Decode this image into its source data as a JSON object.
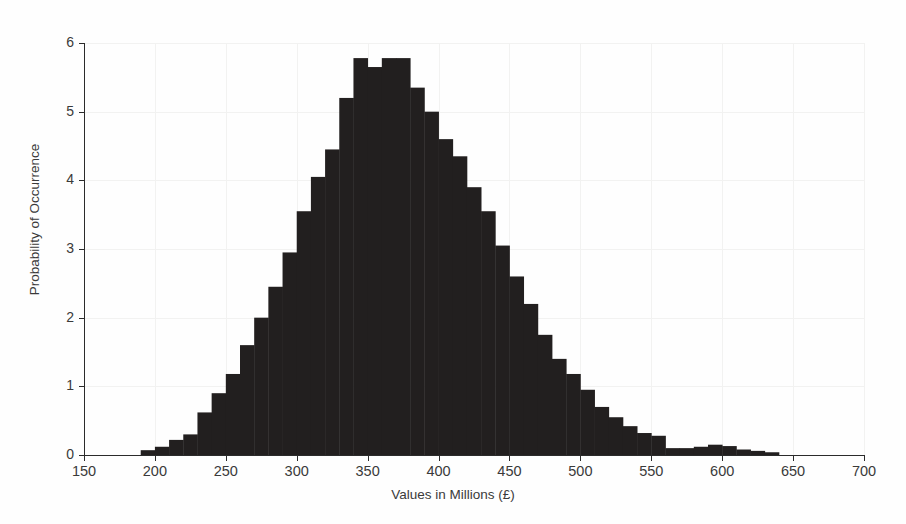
{
  "chart_data": {
    "type": "bar",
    "title": "",
    "subtitle": "",
    "xlabel": "Values in Millions (£)",
    "ylabel": "Probability of Occurrence",
    "xlim": [
      150,
      700
    ],
    "ylim": [
      0,
      6
    ],
    "xticks": [
      150,
      200,
      250,
      300,
      350,
      400,
      450,
      500,
      550,
      600,
      650,
      700
    ],
    "yticks": [
      0,
      1,
      2,
      3,
      4,
      5,
      6
    ],
    "xtick_labels": [
      "150",
      "200",
      "250",
      "300",
      "350",
      "400",
      "450",
      "500",
      "550",
      "600",
      "650",
      "700"
    ],
    "ytick_labels": [
      "0",
      "1",
      "2",
      "3",
      "4",
      "5",
      "6"
    ],
    "grid": true,
    "legend": null,
    "bar_color": "#221f1f",
    "bin_width": 10,
    "categories": [
      190,
      200,
      210,
      220,
      230,
      240,
      250,
      260,
      270,
      280,
      290,
      300,
      310,
      320,
      330,
      340,
      350,
      360,
      370,
      380,
      390,
      400,
      410,
      420,
      430,
      440,
      450,
      460,
      470,
      480,
      490,
      500,
      510,
      520,
      530,
      540,
      550,
      560,
      570,
      580,
      590,
      600,
      610,
      620,
      630
    ],
    "values": [
      0.07,
      0.12,
      0.22,
      0.3,
      0.62,
      0.9,
      1.18,
      1.6,
      2.0,
      2.45,
      2.95,
      3.55,
      4.05,
      4.45,
      5.2,
      5.78,
      5.65,
      5.78,
      5.78,
      5.35,
      5.0,
      4.6,
      4.35,
      3.9,
      3.55,
      3.05,
      2.6,
      2.2,
      1.75,
      1.4,
      1.18,
      0.95,
      0.7,
      0.55,
      0.42,
      0.32,
      0.28,
      0.1,
      0.1,
      0.12,
      0.15,
      0.13,
      0.08,
      0.06,
      0.04
    ]
  }
}
